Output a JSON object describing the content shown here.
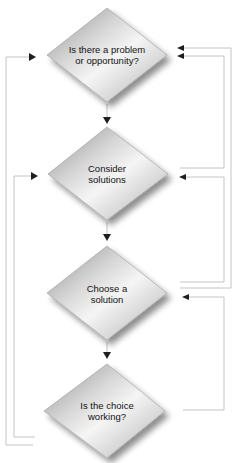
{
  "diagram": {
    "type": "flowchart",
    "colors": {
      "diamond_light": "#f4f4f4",
      "diamond_mid": "#c8c8c8",
      "diamond_dark": "#8a8a8a",
      "connector": "#c8c8c8",
      "arrowhead": "#222222",
      "text": "#111111"
    },
    "nodes": [
      {
        "id": "problem",
        "shape": "diamond",
        "label": "Is there a problem\nor opportunity?"
      },
      {
        "id": "consider",
        "shape": "diamond",
        "label": "Consider\nsolutions"
      },
      {
        "id": "choose",
        "shape": "diamond",
        "label": "Choose a\nsolution"
      },
      {
        "id": "working",
        "shape": "diamond",
        "label": "Is the choice\nworking?"
      }
    ],
    "edges": [
      {
        "from": "problem",
        "to": "consider",
        "direction": "down"
      },
      {
        "from": "consider",
        "to": "choose",
        "direction": "down"
      },
      {
        "from": "choose",
        "to": "working",
        "direction": "down"
      },
      {
        "from": "working",
        "to": "problem",
        "side": "left",
        "kind": "feedback"
      },
      {
        "from": "working",
        "to": "consider",
        "side": "left",
        "kind": "feedback"
      },
      {
        "from": "consider",
        "to": "problem",
        "side": "right",
        "kind": "feedback"
      },
      {
        "from": "choose",
        "to": "problem",
        "side": "right",
        "kind": "feedback"
      },
      {
        "from": "choose",
        "to": "consider",
        "side": "right",
        "kind": "feedback"
      },
      {
        "from": "working",
        "to": "choose",
        "side": "right",
        "kind": "feedback"
      }
    ]
  }
}
